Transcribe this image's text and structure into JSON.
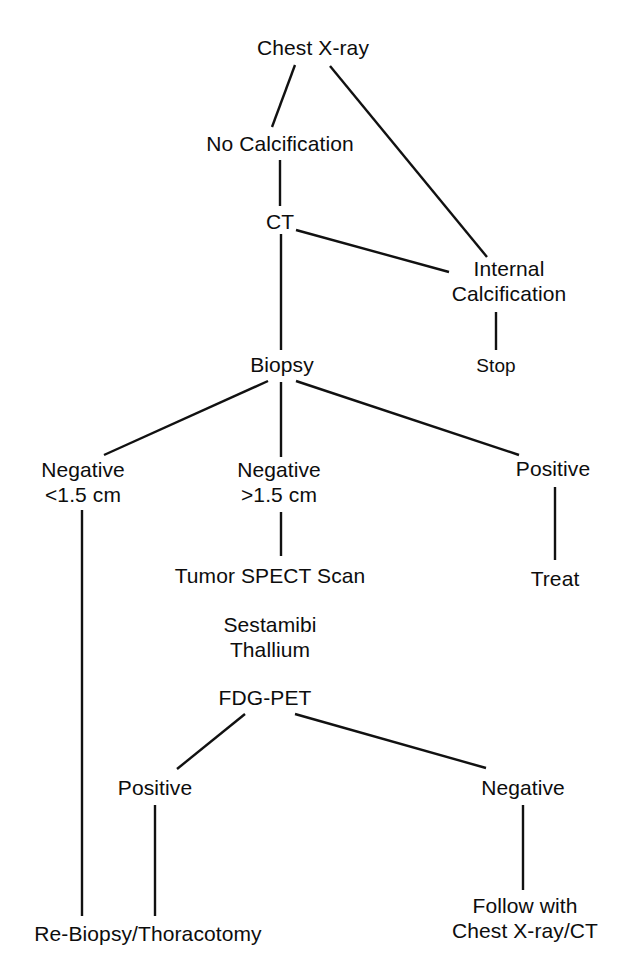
{
  "diagram": {
    "type": "flowchart",
    "background_color": "#ffffff",
    "line_color": "#111111",
    "text_color": "#0d0d0d",
    "canvas": {
      "width": 626,
      "height": 967
    },
    "nodes": [
      {
        "id": "chest-xray",
        "label": "Chest X-ray",
        "x": 313,
        "y": 47,
        "size": "normal"
      },
      {
        "id": "no-calcification",
        "label": "No Calcification",
        "x": 280,
        "y": 143,
        "size": "normal"
      },
      {
        "id": "internal-calcification",
        "label": "Internal\nCalcification",
        "x": 509,
        "y": 281,
        "size": "normal"
      },
      {
        "id": "stop",
        "label": "Stop",
        "x": 496,
        "y": 365,
        "size": "small"
      },
      {
        "id": "ct",
        "label": "CT",
        "x": 280,
        "y": 221,
        "size": "normal"
      },
      {
        "id": "biopsy",
        "label": "Biopsy",
        "x": 282,
        "y": 364,
        "size": "normal"
      },
      {
        "id": "negative-small",
        "label": "Negative\n<1.5 cm",
        "x": 83,
        "y": 482,
        "size": "normal"
      },
      {
        "id": "negative-large",
        "label": "Negative\n>1.5 cm",
        "x": 279,
        "y": 482,
        "size": "normal"
      },
      {
        "id": "biopsy-positive",
        "label": "Positive",
        "x": 553,
        "y": 468,
        "size": "normal"
      },
      {
        "id": "treat",
        "label": "Treat",
        "x": 555,
        "y": 578,
        "size": "normal"
      },
      {
        "id": "tumor-spect-scan",
        "label": "Tumor SPECT Scan",
        "x": 270,
        "y": 575,
        "size": "normal"
      },
      {
        "id": "sestamibi-thallium",
        "label": "Sestamibi\nThallium",
        "x": 270,
        "y": 637,
        "size": "normal"
      },
      {
        "id": "fdg-pet",
        "label": "FDG-PET",
        "x": 265,
        "y": 697,
        "size": "normal"
      },
      {
        "id": "pet-positive",
        "label": "Positive",
        "x": 155,
        "y": 787,
        "size": "normal"
      },
      {
        "id": "pet-negative",
        "label": "Negative",
        "x": 523,
        "y": 787,
        "size": "normal"
      },
      {
        "id": "re-biopsy-thoracotomy",
        "label": "Re-Biopsy/Thoracotomy",
        "x": 148,
        "y": 933,
        "size": "normal"
      },
      {
        "id": "follow-with",
        "label": "Follow with\nChest X-ray/CT",
        "x": 525,
        "y": 918,
        "size": "normal"
      }
    ],
    "edges": [
      {
        "id": "edge-chest-xray-to-no-calcification",
        "from": "chest-xray",
        "to": "no-calcification",
        "x1": 295,
        "y1": 65,
        "x2": 272,
        "y2": 127
      },
      {
        "id": "edge-chest-xray-to-internal-calcification",
        "from": "chest-xray",
        "to": "internal-calcification",
        "x1": 330,
        "y1": 66,
        "x2": 487,
        "y2": 257
      },
      {
        "id": "edge-no-calcification-to-ct",
        "from": "no-calcification",
        "to": "ct",
        "x1": 280,
        "y1": 160,
        "x2": 280,
        "y2": 206
      },
      {
        "id": "edge-ct-to-internal-calcification",
        "from": "ct",
        "to": "internal-calcification",
        "x1": 296,
        "y1": 230,
        "x2": 449,
        "y2": 272
      },
      {
        "id": "edge-internal-calcification-to-stop",
        "from": "internal-calcification",
        "to": "stop",
        "x1": 496,
        "y1": 312,
        "x2": 496,
        "y2": 350
      },
      {
        "id": "edge-ct-to-biopsy",
        "from": "ct",
        "to": "biopsy",
        "x1": 281,
        "y1": 234,
        "x2": 281,
        "y2": 350
      },
      {
        "id": "edge-biopsy-to-negative-small",
        "from": "biopsy",
        "to": "negative-small",
        "x1": 268,
        "y1": 381,
        "x2": 104,
        "y2": 455
      },
      {
        "id": "edge-biopsy-to-negative-large",
        "from": "biopsy",
        "to": "negative-large",
        "x1": 281,
        "y1": 382,
        "x2": 281,
        "y2": 457
      },
      {
        "id": "edge-biopsy-to-positive",
        "from": "biopsy",
        "to": "biopsy-positive",
        "x1": 296,
        "y1": 381,
        "x2": 519,
        "y2": 455
      },
      {
        "id": "edge-positive-to-treat",
        "from": "biopsy-positive",
        "to": "treat",
        "x1": 555,
        "y1": 487,
        "x2": 555,
        "y2": 560
      },
      {
        "id": "edge-negative-large-to-spect",
        "from": "negative-large",
        "to": "tumor-spect-scan",
        "x1": 281,
        "y1": 512,
        "x2": 281,
        "y2": 556
      },
      {
        "id": "edge-fdg-pet-to-pet-positive",
        "from": "fdg-pet",
        "to": "pet-positive",
        "x1": 245,
        "y1": 714,
        "x2": 177,
        "y2": 769
      },
      {
        "id": "edge-fdg-pet-to-pet-negative",
        "from": "fdg-pet",
        "to": "pet-negative",
        "x1": 295,
        "y1": 714,
        "x2": 486,
        "y2": 768
      },
      {
        "id": "edge-pet-positive-to-re-biopsy",
        "from": "pet-positive",
        "to": "re-biopsy-thoracotomy",
        "x1": 155,
        "y1": 805,
        "x2": 155,
        "y2": 916
      },
      {
        "id": "edge-negative-small-to-re-biopsy",
        "from": "negative-small",
        "to": "re-biopsy-thoracotomy",
        "x1": 82,
        "y1": 510,
        "x2": 82,
        "y2": 916
      },
      {
        "id": "edge-pet-negative-to-follow-with",
        "from": "pet-negative",
        "to": "follow-with",
        "x1": 523,
        "y1": 805,
        "x2": 523,
        "y2": 890
      }
    ]
  }
}
